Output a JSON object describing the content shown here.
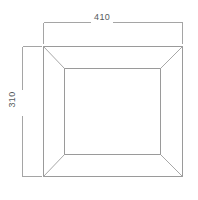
{
  "drawing": {
    "type": "technical-line-drawing",
    "subject": "rectangular frame / panel, front elevation with bevelled border",
    "background_color": "#ffffff",
    "line_color": "#9a9a9a",
    "text_color": "#55595c",
    "dimensions": {
      "width": {
        "value": "410",
        "orientation": "horizontal",
        "position": "top"
      },
      "height": {
        "value": "310",
        "orientation": "vertical-rotated",
        "position": "left"
      }
    },
    "geometry": {
      "outer_rect": {
        "x1": 43,
        "y1": 46,
        "x2": 183,
        "y2": 177
      },
      "inner_rect": {
        "x1": 64,
        "y1": 68,
        "x2": 161,
        "y2": 155
      },
      "miters": 4,
      "width_dim_line_y": 22,
      "height_dim_line_x": 22
    }
  }
}
